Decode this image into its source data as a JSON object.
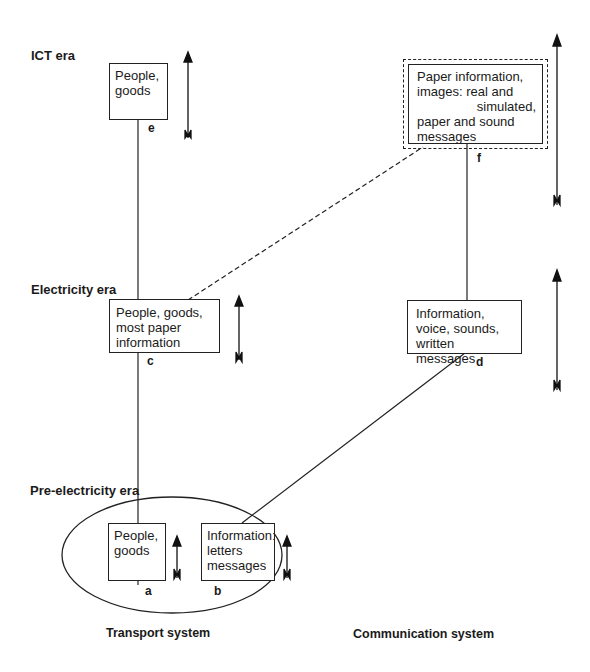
{
  "eras": {
    "ict": "ICT era",
    "electricity": "Electricity era",
    "pre_electricity": "Pre-electricity era"
  },
  "nodes": {
    "a": {
      "letter": "a",
      "line1": "People,",
      "line2": "goods"
    },
    "b": {
      "letter": "b",
      "line1": "Information:",
      "line2": "letters",
      "line3": "messages"
    },
    "c": {
      "letter": "c",
      "line1": "People, goods,",
      "line2": "most paper",
      "line3": "information"
    },
    "d": {
      "letter": "d",
      "line1": "Information,",
      "line2": "voice, sounds,",
      "line3": "written messages"
    },
    "e": {
      "letter": "e",
      "line1": "People,",
      "line2": "goods"
    },
    "f": {
      "letter": "f",
      "line1": "Paper information,",
      "line2": "images: real and",
      "line3": "simulated,",
      "line4": "paper and sound",
      "line5": "messages"
    }
  },
  "axes": {
    "left": "Transport system",
    "right": "Communication system"
  }
}
